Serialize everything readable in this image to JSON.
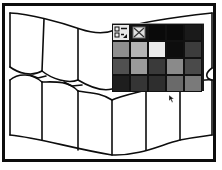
{
  "canvas": {
    "description": "Tiled wavy drawing with palette popup",
    "stroke_color": "#0d0d0d",
    "background": "#ffffff"
  },
  "palette": {
    "tool_icon": "fill-stroke-swatch-icon",
    "none_icon": "no-fill-x-icon",
    "rows": [
      [
        "tool",
        "none",
        "#0a0a0a",
        "#0a0a0a",
        "#1a1a1a"
      ],
      [
        "#8e8e8e",
        "#b4b4b4",
        "#ececec",
        "#0d0d0d",
        "#3c3c3c"
      ],
      [
        "#505050",
        "#9a9a9a",
        "#3a3a3a",
        "#8a8a8a",
        "#4a4a4a"
      ],
      [
        "#1e1e1e",
        "#353535",
        "#2e2e2e",
        "#6a6a6a",
        "#7a7a7a"
      ]
    ]
  },
  "cursor": {
    "icon": "arrow-pointer-icon",
    "x": 170,
    "y": 96
  }
}
